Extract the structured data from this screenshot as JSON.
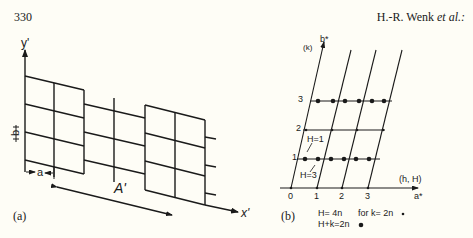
{
  "header": {
    "page_number": "330",
    "authors": "H.-R. Wenk",
    "authors_suffix": "et al.:"
  },
  "figure": {
    "panel_a": {
      "label": "(a)",
      "y_axis_label": "y'",
      "x_axis_label": "x'",
      "cell_a_label": "a",
      "cell_b_label": "b",
      "antiphase_period_label": "A'"
    },
    "panel_b": {
      "label": "(b)",
      "vertical_axis_label": "b*",
      "vertical_axis_sublabel": "(k)",
      "horizontal_axis_label": "a*",
      "horizontal_axis_sublabel": "(h, H)",
      "h_ticks": [
        "0",
        "1",
        "2",
        "3"
      ],
      "k_ticks": [
        "1",
        "2",
        "3"
      ],
      "annotation_upper": "H=1",
      "annotation_lower": "H=3",
      "legend": [
        {
          "text": "H= 4n",
          "extra": "for  k= 2n",
          "marker": "small-dot"
        },
        {
          "text": "H+k=2n",
          "extra": "",
          "marker": "large-dot"
        }
      ]
    }
  }
}
